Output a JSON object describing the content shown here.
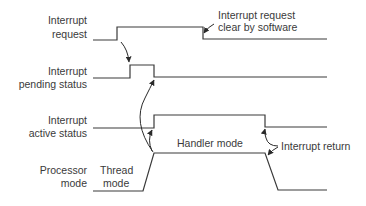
{
  "signals": [
    {
      "id": "interrupt-request",
      "label_lines": [
        "Interrupt",
        "request"
      ]
    },
    {
      "id": "interrupt-pending-status",
      "label_lines": [
        "Interrupt",
        "pending status"
      ]
    },
    {
      "id": "interrupt-active-status",
      "label_lines": [
        "Interrupt",
        "active status"
      ]
    },
    {
      "id": "processor-mode",
      "label_lines": [
        "Processor",
        "mode"
      ]
    }
  ],
  "annotations": {
    "request_clear": [
      "Interrupt request",
      "clear by software"
    ],
    "thread_mode": [
      "Thread",
      "mode"
    ],
    "handler_mode": "Handler mode",
    "interrupt_return": "Interrupt return"
  },
  "colors": {
    "line": "#3a3a3a",
    "text": "#3a3a3a",
    "background": "#ffffff"
  }
}
